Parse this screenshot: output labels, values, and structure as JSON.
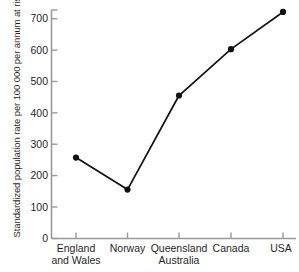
{
  "chart_data": {
    "type": "line",
    "title": "",
    "subtitle": "",
    "xlabel": "",
    "ylabel": "Standardized population rate per 100 000 per annum at risk",
    "categories": [
      "England and Wales",
      "Norway",
      "Queensland Australia",
      "Canada",
      "USA"
    ],
    "category_lines": [
      [
        "England",
        "and Wales"
      ],
      [
        "Norway"
      ],
      [
        "Queensland",
        "Australia"
      ],
      [
        "Canada"
      ],
      [
        "USA"
      ]
    ],
    "values": [
      248,
      150,
      438,
      580,
      694
    ],
    "ylim": [
      0,
      700
    ],
    "ytick_values": [
      0,
      100,
      200,
      300,
      400,
      500,
      600,
      700
    ],
    "ytick_labels": [
      "0",
      "100",
      "200",
      "300",
      "400",
      "500",
      "600",
      "700"
    ],
    "grid": false,
    "legend": null,
    "series": [
      {
        "name": "Standardized population rate",
        "values": [
          248,
          150,
          438,
          580,
          694
        ],
        "color": "#111111",
        "marker": "circle"
      }
    ]
  },
  "style": {
    "line_color": "#111111",
    "marker_color": "#111111",
    "axis_color": "#9a9a9a",
    "text_color": "#1f1f1f",
    "background": "#ffffff"
  }
}
